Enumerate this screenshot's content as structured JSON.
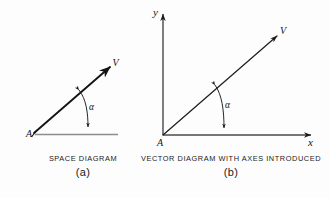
{
  "figure": {
    "background_color": "#fdfdfd",
    "ink_color": "#141414",
    "baseline_color": "#8d8d8d"
  },
  "panels": [
    {
      "id": "a",
      "caption_title": "SPACE  DIAGRAM",
      "caption_label": "(a)",
      "labels": {
        "origin": "A",
        "vector": "V",
        "angle": "α"
      }
    },
    {
      "id": "b",
      "caption_title": "VECTOR DIAGRAM WITH AXES INTRODUCED",
      "caption_label": "(b)",
      "labels": {
        "origin": "A",
        "vector": "V",
        "angle": "α",
        "x_axis": "x",
        "y_axis": "y"
      }
    }
  ]
}
